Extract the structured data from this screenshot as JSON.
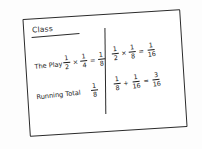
{
  "card": {
    "heading": "Class",
    "rows": [
      {
        "label": "The Play"
      },
      {
        "label": "Running Total"
      }
    ]
  },
  "left_column": {
    "play_expression": {
      "a_num": "1",
      "a_den": "2",
      "op1": "×",
      "b_num": "1",
      "b_den": "4",
      "eq": "=",
      "result_num": "1",
      "result_den": "8"
    },
    "running_total": {
      "num": "1",
      "den": "8"
    }
  },
  "right_column": {
    "play_expression": {
      "a_num": "1",
      "a_den": "2",
      "op1": "×",
      "b_num": "1",
      "b_den": "8",
      "eq": "=",
      "result_num": "1",
      "result_den": "16"
    },
    "running_total": {
      "a_num": "1",
      "a_den": "8",
      "op1": "+",
      "b_num": "1",
      "b_den": "16",
      "eq": "=",
      "result_num": "3",
      "result_den": "16"
    }
  },
  "colors": {
    "ink": "#1d1d1d",
    "paper": "#ffffff",
    "background": "#fdfdfd"
  }
}
